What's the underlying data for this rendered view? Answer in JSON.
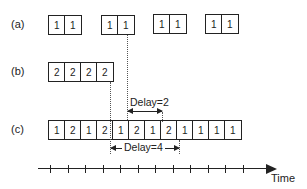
{
  "rows": {
    "a": {
      "label": "(a)",
      "groups": [
        [
          "1",
          "1"
        ],
        [
          "1",
          "1"
        ],
        [
          "1",
          "1"
        ],
        [
          "1",
          "1"
        ]
      ]
    },
    "b": {
      "label": "(b)",
      "cells": [
        "2",
        "2",
        "2",
        "2"
      ]
    },
    "c": {
      "label": "(c)",
      "cells": [
        "1",
        "2",
        "1",
        "2",
        "1",
        "2",
        "1",
        "2",
        "1",
        "1",
        "1",
        "1"
      ]
    }
  },
  "annotations": {
    "delay_top": "Delay=2",
    "delay_bottom": "Delay=4"
  },
  "axis": {
    "label": "Time",
    "ticks": 12
  }
}
